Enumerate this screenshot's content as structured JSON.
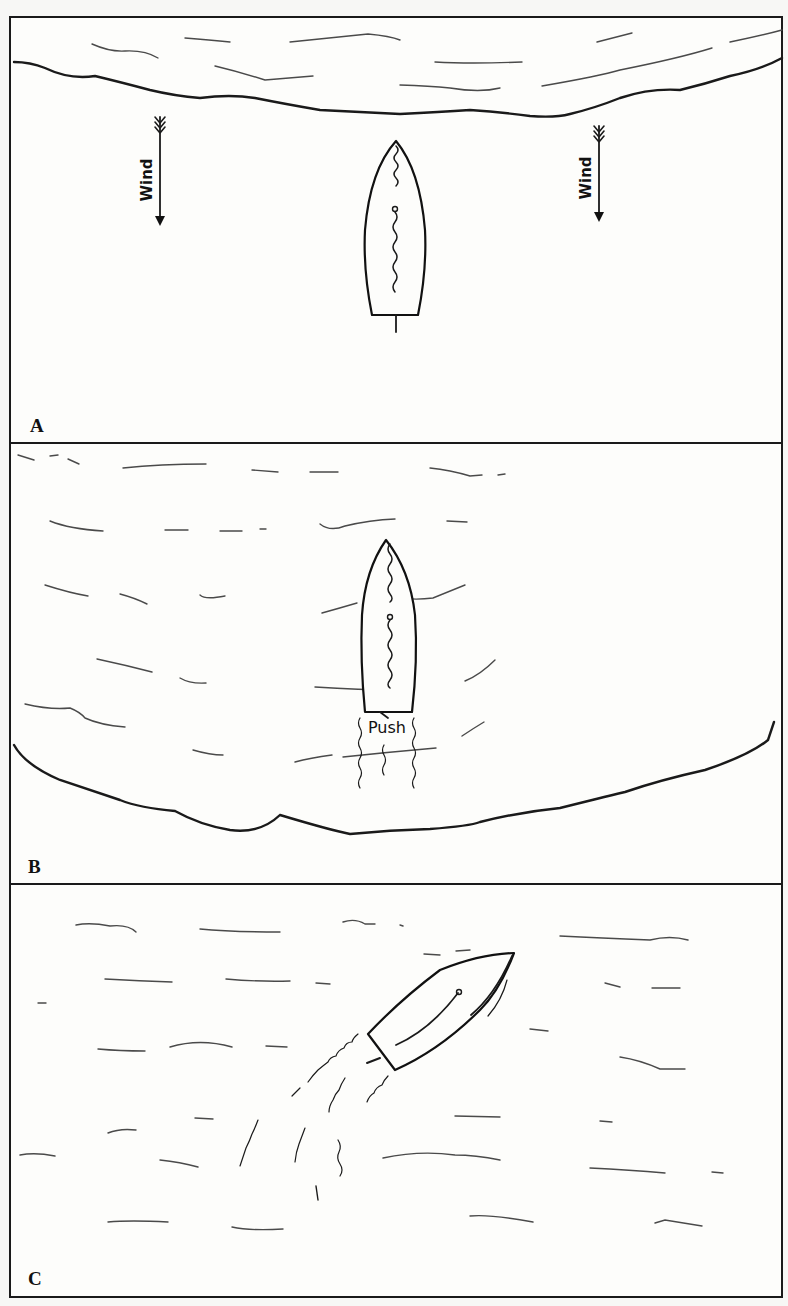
{
  "figure": {
    "panels": [
      {
        "id": "A",
        "label": "A",
        "description": "Boat near upwind shore, wind blowing toward it",
        "annotations": [
          {
            "text": "Wind",
            "position": "left",
            "direction": "down"
          },
          {
            "text": "Wind",
            "position": "right",
            "direction": "down"
          }
        ]
      },
      {
        "id": "B",
        "label": "B",
        "description": "Boat pushed off from shore, wake behind it",
        "annotations": [
          {
            "text": "Push",
            "position": "stern"
          }
        ]
      },
      {
        "id": "C",
        "label": "C",
        "description": "Boat turning away under way, leaving curved wake",
        "annotations": []
      }
    ]
  },
  "colors": {
    "background": "#f7f7f5",
    "ink": "#1a1a1a",
    "wave": "#4a4a4a"
  }
}
